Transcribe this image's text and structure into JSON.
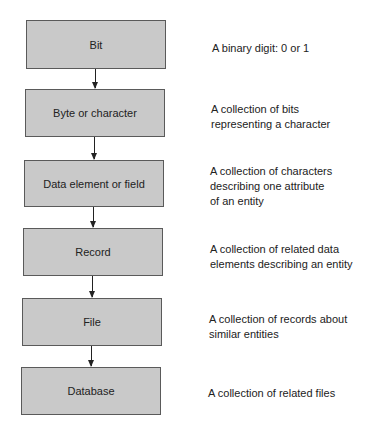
{
  "diagram": {
    "type": "data-hierarchy",
    "levels": [
      {
        "label": "Bit",
        "description": [
          "A binary digit: 0 or 1"
        ]
      },
      {
        "label": "Byte or character",
        "description": [
          "A collection of bits",
          "representing a character"
        ]
      },
      {
        "label": "Data element or field",
        "description": [
          "A collection of characters",
          "describing one attribute",
          "of an entity"
        ]
      },
      {
        "label": "Record",
        "description": [
          "A collection of related data",
          "elements describing an entity"
        ]
      },
      {
        "label": "File",
        "description": [
          "A collection of records about",
          "similar entities"
        ]
      },
      {
        "label": "Database",
        "description": [
          "A collection of related files"
        ]
      }
    ],
    "colors": {
      "box_fill": "#c9c9c9",
      "box_border": "#5a5a5a",
      "text": "#222222"
    }
  }
}
